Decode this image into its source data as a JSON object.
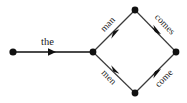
{
  "diagram": {
    "type": "directed-graph",
    "background_color": "#ffffff",
    "edge_color": "#3a3a3a",
    "node_color": "#111111",
    "width": 187,
    "height": 103,
    "nodes": [
      {
        "id": "n0",
        "name": "start-node",
        "x": 13,
        "y": 52
      },
      {
        "id": "n1",
        "name": "junction-node",
        "x": 93,
        "y": 52
      },
      {
        "id": "n2",
        "name": "top-node",
        "x": 135,
        "y": 10
      },
      {
        "id": "n3",
        "name": "bottom-node",
        "x": 135,
        "y": 93
      },
      {
        "id": "n4",
        "name": "end-node",
        "x": 176,
        "y": 52
      }
    ],
    "edges": [
      {
        "id": "e0",
        "label": "the",
        "from": "n0",
        "to": "n1",
        "arrow_at": [
          52,
          52
        ],
        "thick": true
      },
      {
        "id": "e1",
        "label": "man",
        "from": "n1",
        "to": "n2",
        "arrow_at": [
          115,
          31
        ],
        "thick": false
      },
      {
        "id": "e2",
        "label": "men",
        "from": "n1",
        "to": "n3",
        "arrow_at": [
          115,
          73
        ],
        "thick": false
      },
      {
        "id": "e3",
        "label": "comes",
        "from": "n2",
        "to": "n4",
        "arrow_at": [
          156,
          31
        ],
        "thick": false
      },
      {
        "id": "e4",
        "label": "come",
        "from": "n3",
        "to": "n4",
        "arrow_at": [
          156,
          73
        ],
        "thick": false
      }
    ],
    "labels": {
      "the": "the",
      "man": "man",
      "men": "men",
      "comes": "comes",
      "come": "come"
    }
  }
}
